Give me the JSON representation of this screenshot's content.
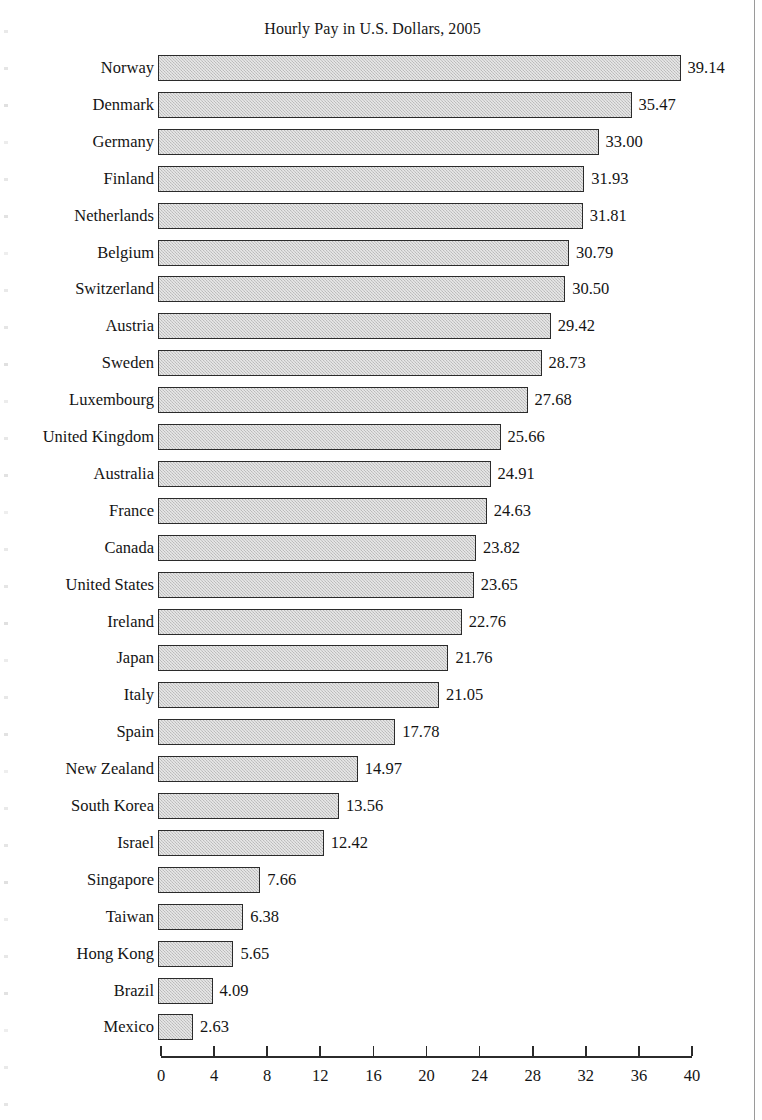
{
  "chart_data": {
    "type": "bar",
    "orientation": "horizontal",
    "title": "Hourly Pay in U.S. Dollars, 2005",
    "xlabel": "",
    "ylabel": "",
    "xlim": [
      0,
      40
    ],
    "xticks": [
      0,
      4,
      8,
      12,
      16,
      20,
      24,
      28,
      32,
      36,
      40
    ],
    "grid": false,
    "legend": null,
    "bar_fill_color": "#c9c9c9",
    "bar_border_color": "#2b2b2b",
    "categories": [
      "Norway",
      "Denmark",
      "Germany",
      "Finland",
      "Netherlands",
      "Belgium",
      "Switzerland",
      "Austria",
      "Sweden",
      "Luxembourg",
      "United Kingdom",
      "Australia",
      "France",
      "Canada",
      "United States",
      "Ireland",
      "Japan",
      "Italy",
      "Spain",
      "New Zealand",
      "South Korea",
      "Israel",
      "Singapore",
      "Taiwan",
      "Hong Kong",
      "Brazil",
      "Mexico"
    ],
    "values": [
      39.14,
      35.47,
      33.0,
      31.93,
      31.81,
      30.79,
      30.5,
      29.42,
      28.73,
      27.68,
      25.66,
      24.91,
      24.63,
      23.82,
      23.65,
      22.76,
      21.76,
      21.05,
      17.78,
      14.97,
      13.56,
      12.42,
      7.66,
      6.38,
      5.65,
      4.09,
      2.63
    ],
    "value_labels": [
      "39.14",
      "35.47",
      "33.00",
      "31.93",
      "31.81",
      "30.79",
      "30.50",
      "29.42",
      "28.73",
      "27.68",
      "25.66",
      "24.91",
      "24.63",
      "23.82",
      "23.65",
      "22.76",
      "21.76",
      "21.05",
      "17.78",
      "14.97",
      "13.56",
      "12.42",
      "7.66",
      "6.38",
      "5.65",
      "4.09",
      "2.63"
    ]
  }
}
